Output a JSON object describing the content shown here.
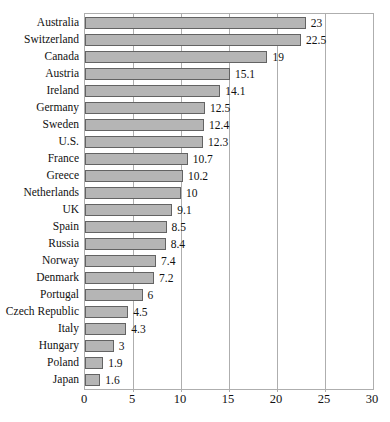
{
  "chart_data": {
    "type": "bar",
    "orientation": "horizontal",
    "title": "",
    "xlabel": "",
    "ylabel": "",
    "categories": [
      "Australia",
      "Switzerland",
      "Canada",
      "Austria",
      "Ireland",
      "Germany",
      "Sweden",
      "U.S.",
      "France",
      "Greece",
      "Netherlands",
      "UK",
      "Spain",
      "Russia",
      "Norway",
      "Denmark",
      "Portugal",
      "Czech Republic",
      "Italy",
      "Hungary",
      "Poland",
      "Japan"
    ],
    "values": [
      23,
      22.5,
      19,
      15.1,
      14.1,
      12.5,
      12.4,
      12.3,
      10.7,
      10.2,
      10,
      9.1,
      8.5,
      8.4,
      7.4,
      7.2,
      6,
      4.5,
      4.3,
      3,
      1.9,
      1.6
    ],
    "value_labels": [
      "23",
      "22.5",
      "19",
      "15.1",
      "14.1",
      "12.5",
      "12.4",
      "12.3",
      "10.7",
      "10.2",
      "10",
      "9.1",
      "8.5",
      "8.4",
      "7.4",
      "7.2",
      "6",
      "4.5",
      "4.3",
      "3",
      "1.9",
      "1.6"
    ],
    "x_ticks": [
      0,
      5,
      10,
      15,
      20,
      25,
      30
    ],
    "xlim": [
      0,
      30
    ],
    "grid": true,
    "legend": "none",
    "colors": {
      "bar_fill": "#b5b5b5",
      "bar_border": "#636363",
      "grid_line": "#aeaeae",
      "text": "#111111",
      "background": "#ffffff"
    }
  }
}
